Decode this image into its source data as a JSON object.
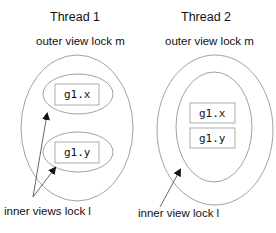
{
  "thread1": {
    "title": "Thread 1",
    "outer_label": "outer view  lock m",
    "boxes": [
      "g1.x",
      "g1.y"
    ],
    "inner_label": "inner views lock l"
  },
  "thread2": {
    "title": "Thread 2",
    "outer_label": "outer view  lock m",
    "boxes": [
      "g1.x",
      "g1.y"
    ],
    "inner_label": "inner view lock l"
  },
  "colors": {
    "stroke": "#8a8a8a",
    "box_stroke": "#9a9a9a",
    "text": "#111111"
  }
}
